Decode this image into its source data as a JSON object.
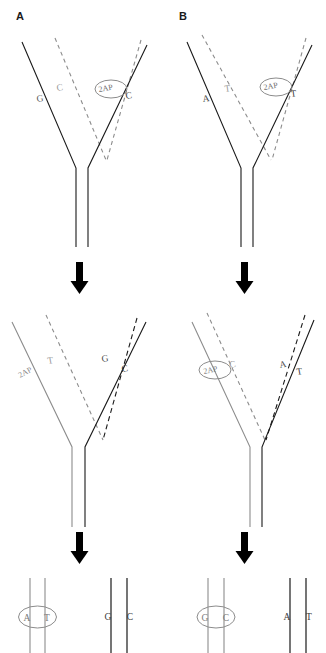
{
  "figure": {
    "panels": [
      {
        "id": "A",
        "label": "A",
        "stages": [
          {
            "stage": "fork-top",
            "left_arm": {
              "template": {
                "base": "G",
                "style": "solid",
                "color": "#1a1a1a"
              },
              "nascent": {
                "base": "C",
                "style": "dashed",
                "color": "#8c8c8c"
              }
            },
            "right_arm": {
              "nascent": {
                "base": "2AP",
                "style": "dashed",
                "color": "#8c8c8c",
                "circled": true
              },
              "template": {
                "base": "C",
                "style": "solid",
                "color": "#1a1a1a"
              }
            }
          },
          {
            "stage": "fork-middle",
            "left_arm": {
              "template": {
                "base": "2AP",
                "style": "solid",
                "color": "#8c8c8c",
                "circled": false
              },
              "nascent": {
                "base": "T",
                "style": "dashed",
                "color": "#8c8c8c"
              }
            },
            "right_arm": {
              "nascent": {
                "base": "G",
                "style": "dashed",
                "color": "#1a1a1a"
              },
              "template": {
                "base": "C",
                "style": "solid",
                "color": "#1a1a1a"
              }
            }
          },
          {
            "stage": "duplex-bottom",
            "left_duplex": {
              "bases": [
                "A",
                "T"
              ],
              "color": "#8c8c8c",
              "circled": true
            },
            "right_duplex": {
              "bases": [
                "G",
                "C"
              ],
              "color": "#1a1a1a",
              "circled": false
            }
          }
        ]
      },
      {
        "id": "B",
        "label": "B",
        "stages": [
          {
            "stage": "fork-top",
            "left_arm": {
              "template": {
                "base": "A",
                "style": "solid",
                "color": "#1a1a1a"
              },
              "nascent": {
                "base": "T",
                "style": "dashed",
                "color": "#8c8c8c"
              }
            },
            "right_arm": {
              "nascent": {
                "base": "2AP",
                "style": "dashed",
                "color": "#8c8c8c",
                "circled": true
              },
              "template": {
                "base": "T",
                "style": "solid",
                "color": "#1a1a1a"
              }
            }
          },
          {
            "stage": "fork-middle",
            "left_arm": {
              "template": {
                "base": "2AP",
                "style": "solid",
                "color": "#8c8c8c",
                "circled": true
              },
              "nascent": {
                "base": "C",
                "style": "dashed",
                "color": "#8c8c8c"
              }
            },
            "right_arm": {
              "nascent": {
                "base": "A",
                "style": "dashed",
                "color": "#1a1a1a"
              },
              "template": {
                "base": "T",
                "style": "solid",
                "color": "#1a1a1a"
              }
            }
          },
          {
            "stage": "duplex-bottom",
            "left_duplex": {
              "bases": [
                "G",
                "C"
              ],
              "color": "#8c8c8c",
              "circled": true
            },
            "right_duplex": {
              "bases": [
                "A",
                "T"
              ],
              "color": "#1a1a1a",
              "circled": false
            }
          }
        ]
      }
    ],
    "arrows": {
      "glyph": "down-arrow",
      "count": 4,
      "color": "#000000"
    },
    "colors": {
      "black_strand": "#1a1a1a",
      "gray_strand": "#8c8c8c",
      "arrow": "#000000",
      "background": "#ffffff"
    }
  }
}
